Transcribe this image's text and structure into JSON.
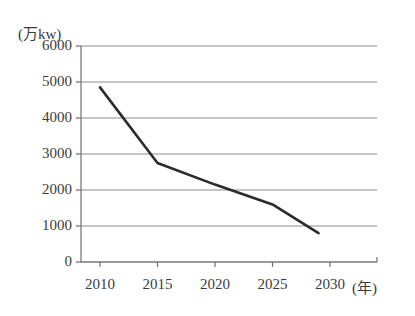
{
  "chart_data": {
    "type": "line",
    "title": "",
    "subtitle": "",
    "xlabel": "(年)",
    "ylabel": "(万kw)",
    "xlim": [
      2008,
      2031
    ],
    "ylim": [
      0,
      6000
    ],
    "grid": true,
    "legend": "none",
    "y_ticks": [
      6000,
      5000,
      4000,
      3000,
      2000,
      1000,
      0
    ],
    "y_tick_labels": [
      "6000",
      "5000",
      "4000",
      "3000",
      "2000",
      "1000",
      "0"
    ],
    "x_ticks": [
      2010,
      2015,
      2020,
      2025,
      2030
    ],
    "x_tick_labels": [
      "2010",
      "2015",
      "2020",
      "2025",
      "2030"
    ],
    "series": [
      {
        "name": "",
        "color": "#2b2b2b",
        "x": [
          2010,
          2015,
          2020,
          2025,
          2029
        ],
        "values": [
          4850,
          2750,
          2150,
          1600,
          800
        ]
      }
    ]
  },
  "axes": {
    "unit_label": "(万kw)",
    "x_unit_label": "(年)",
    "y_labels": [
      "6000",
      "5000",
      "4000",
      "3000",
      "2000",
      "1000",
      "0"
    ],
    "x_labels": [
      "2010",
      "2015",
      "2020",
      "2025",
      "2030"
    ]
  },
  "colors": {
    "line": "#2b2b2b",
    "grid": "#8c8c8c",
    "axis": "#6f6f6f",
    "text": "#3b3b3b",
    "background": "#ffffff"
  }
}
